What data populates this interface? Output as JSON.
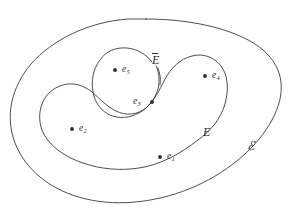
{
  "figure": {
    "kind": "set-diagram",
    "width": 292,
    "height": 219,
    "background_color": "#ffffff",
    "stroke_color": "#3a3a3a",
    "text_color": "#2b2b2b"
  },
  "sets": {
    "universe": {
      "label": "ℰ",
      "name": "universal-set",
      "label_x": 247,
      "label_y": 140
    },
    "outer_subset": {
      "label": "E",
      "name": "set-e",
      "label_x": 203,
      "label_y": 126
    },
    "inner_subset": {
      "label_base": "E",
      "label": "E̅",
      "name": "set-e-bar",
      "label_x": 152,
      "label_y": 54
    }
  },
  "points": [
    {
      "id": "e1",
      "label_base": "e",
      "subscript": "1",
      "dot_x": 160,
      "dot_y": 157,
      "label_x": 167,
      "label_y": 152,
      "label_side": "right"
    },
    {
      "id": "e2",
      "label_base": "e",
      "subscript": "2",
      "dot_x": 72,
      "dot_y": 129,
      "label_x": 79,
      "label_y": 124,
      "label_side": "right"
    },
    {
      "id": "e3",
      "label_base": "e",
      "subscript": "3",
      "dot_x": 152,
      "dot_y": 102,
      "label_x": 133,
      "label_y": 97,
      "label_side": "left"
    },
    {
      "id": "e4",
      "label_base": "e",
      "subscript": "4",
      "dot_x": 205,
      "dot_y": 76,
      "label_x": 212,
      "label_y": 71,
      "label_side": "right"
    },
    {
      "id": "e5",
      "label_base": "e",
      "subscript": "5",
      "dot_x": 115,
      "dot_y": 70,
      "label_x": 122,
      "label_y": 65,
      "label_side": "right"
    }
  ],
  "paths": {
    "universe_outline": "M 146 19 C 196 19 241 31 263 50 C 285 69 286 94 272 120 C 258 146 231 170 196 186 C 160 202 120 207 86 199 C 52 191 26 171 15 143 C 5 116 11 88 31 64 C 52 40 88 22 128 19 C 134 19 140 19 146 19 Z",
    "set_e_outline": "M 198 140 C 211 131 221 118 225 104 C 229 89 228 75 221 66 C 214 57 203 53 192 56 C 180 59 171 68 165 79 C 159 91 154 101 146 108 C 137 115 126 116 116 111 C 106 106 99 98 92 92 C 83 85 73 82 63 85 C 52 88 44 96 41 107 C 38 118 40 130 47 139 C 55 150 68 158 83 163 C 100 169 120 171 139 168 C 160 165 180 154 198 140",
    "set_e_bar_outline_part1": "M 152 62 C 146 54 137 49 127 48 C 116 47 106 51 100 60 C 93 69 91 81 93 92 C 95 103 101 111 110 115 C 119 119 130 118 139 113 C 148 108 155 99 158 89 C 160 81 159 71 156 66",
    "set_e_bar_outline_part2": "M 158 68 C 160 73 161 79 160 85"
  }
}
